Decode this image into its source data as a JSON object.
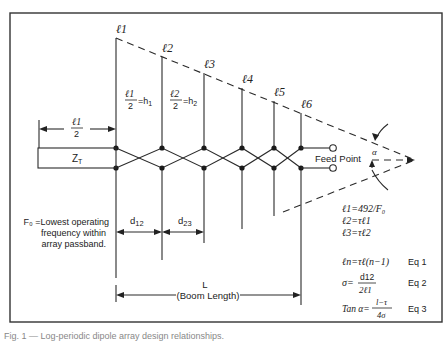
{
  "diagram": {
    "type": "log-periodic dipole array schematic",
    "element_labels": [
      "ℓ1",
      "ℓ2",
      "ℓ3",
      "ℓ4",
      "ℓ5",
      "ℓ6"
    ],
    "half_length_labels": [
      {
        "num": "ℓ1",
        "den": "2",
        "eq": "=h",
        "sub": "1"
      },
      {
        "num": "ℓ2",
        "den": "2",
        "eq": "=h",
        "sub": "2"
      }
    ],
    "half_dim": {
      "num": "ℓ1",
      "den": "2"
    },
    "termination": {
      "label": "Z",
      "sub": "T"
    },
    "feed_point": "Feed Point",
    "alpha": "α",
    "spacing": [
      {
        "label": "d",
        "sub": "12"
      },
      {
        "label": "d",
        "sub": "23"
      }
    ],
    "boom": {
      "label": "L",
      "sublabel": "(Boom Length)"
    },
    "fo_note": [
      "F₀ =Lowest operating",
      "frequency within",
      "array passband."
    ],
    "formulas": {
      "l1": "ℓ1=492/F₀",
      "l2": "ℓ2=τℓ1",
      "l3": "ℓ3=τℓ2"
    },
    "equations": [
      {
        "lhs": "ℓn=τℓ(n−1)",
        "tag": "Eq 1"
      },
      {
        "lhs": "σ=",
        "num": "d12",
        "den": "2ℓ1",
        "tag": "Eq 2"
      },
      {
        "lhs": "Tan α=",
        "num": "l−τ",
        "den": "4σ",
        "tag": "Eq 3"
      }
    ]
  },
  "caption": "Fig. 1 — Log-periodic dipole array design relationships."
}
